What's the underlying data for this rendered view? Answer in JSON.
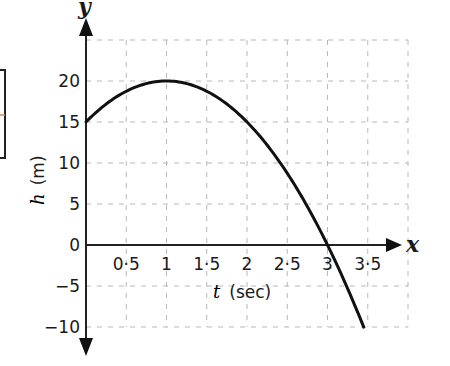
{
  "chart_data": {
    "type": "line",
    "title": "",
    "xlabel_var": "t",
    "xlabel_unit": "(sec)",
    "ylabel_var": "h",
    "ylabel_unit": "(m)",
    "x_axis_name": "x",
    "y_axis_name": "y",
    "xlim": [
      0,
      4
    ],
    "ylim": [
      -12.5,
      27.5
    ],
    "x_ticks": [
      0.5,
      1,
      1.5,
      2,
      2.5,
      3,
      3.5
    ],
    "x_tick_labels": [
      "0·5",
      "1",
      "1·5",
      "2",
      "2·5",
      "3",
      "3·5"
    ],
    "y_ticks": [
      20,
      15,
      10,
      5,
      0,
      -5,
      -10
    ],
    "y_tick_labels": [
      "20",
      "15",
      "10",
      "5",
      "0",
      "−5",
      "−10"
    ],
    "grid": true,
    "grid_x_lines": [
      0.5,
      1,
      1.5,
      2,
      2.5,
      3,
      3.5,
      4
    ],
    "grid_y_lines": [
      25,
      20,
      15,
      10,
      5,
      -5,
      -10
    ],
    "series": [
      {
        "name": "h(t) = 15 + 10t − 5t²",
        "equation_coefficients": {
          "a": -5,
          "b": 10,
          "c": 15
        },
        "t_range": [
          0,
          3.45
        ],
        "x": [
          0,
          0.5,
          1,
          1.5,
          2,
          2.5,
          3,
          3.45
        ],
        "y": [
          15,
          18.75,
          20,
          18.75,
          15,
          8.75,
          0,
          -10
        ]
      }
    ]
  },
  "colors": {
    "curve": "#111111",
    "axis": "#222222",
    "grid": "#b8b8b8",
    "left_box_tick": "#d08a5a"
  }
}
